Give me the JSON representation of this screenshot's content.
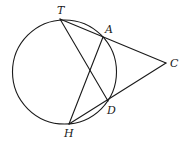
{
  "diagram": {
    "type": "geometry",
    "circle": {
      "cx": 64.5,
      "cy": 72,
      "r": 52
    },
    "points": {
      "T": {
        "label": "T",
        "x": 60,
        "y": 19,
        "lx": 57,
        "ly": 14
      },
      "A": {
        "label": "A",
        "x": 103,
        "y": 37,
        "lx": 105,
        "ly": 33
      },
      "C": {
        "label": "C",
        "x": 166,
        "y": 63,
        "lx": 170,
        "ly": 67
      },
      "D": {
        "label": "D",
        "x": 108,
        "y": 101,
        "lx": 107,
        "ly": 114
      },
      "H": {
        "label": "H",
        "x": 69,
        "y": 124,
        "lx": 64,
        "ly": 137
      }
    },
    "segments": [
      {
        "name": "secant-T-C",
        "from": "T",
        "to": "C"
      },
      {
        "name": "secant-H-C",
        "from": "H",
        "to": "C"
      },
      {
        "name": "chord-T-D",
        "from": "T",
        "to": "D"
      },
      {
        "name": "chord-H-A",
        "from": "H",
        "to": "A"
      }
    ],
    "labels": [
      "T",
      "A",
      "C",
      "D",
      "H"
    ]
  }
}
